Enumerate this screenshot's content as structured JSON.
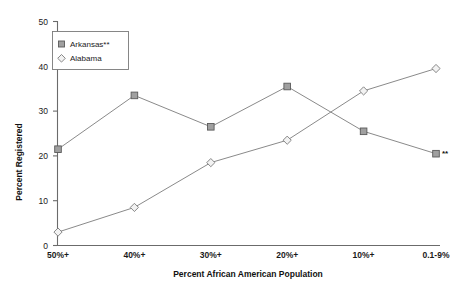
{
  "chart_data": {
    "type": "line",
    "title": "",
    "xlabel": "Percent African American Population",
    "ylabel": "Percent Registered",
    "categories": [
      "50%+",
      "40%+",
      "30%+",
      "20%+",
      "10%+",
      "0.1-9%"
    ],
    "ylim": [
      0,
      50
    ],
    "yticks": [
      0,
      10,
      20,
      30,
      40,
      50
    ],
    "ytick_labels": [
      "0",
      "10",
      "20",
      "30",
      "40",
      "50"
    ],
    "grid": false,
    "legend_position": "top-left",
    "series": [
      {
        "name": "Arkansas**",
        "marker": "square",
        "values": [
          21.5,
          33.5,
          26.5,
          35.5,
          25.5,
          20.5
        ]
      },
      {
        "name": "Alabama",
        "marker": "diamond",
        "values": [
          3.0,
          8.5,
          18.5,
          23.5,
          34.5,
          39.5
        ]
      }
    ],
    "annotations": [
      {
        "text": "**",
        "series": "Arkansas**",
        "category": "0.1-9%"
      }
    ]
  },
  "legend": {
    "entries": [
      {
        "label": "Arkansas**",
        "marker": "square-marker-icon"
      },
      {
        "label": "Alabama",
        "marker": "diamond-marker-icon"
      }
    ]
  },
  "axes": {
    "y_title": "Percent Registered",
    "x_title": "Percent African American Population",
    "y_labels": [
      "50",
      "40",
      "30",
      "20",
      "10",
      "0"
    ],
    "x_labels": [
      "50%+",
      "40%+",
      "30%+",
      "20%+",
      "10%+",
      "0.1-9%"
    ]
  },
  "colors": {
    "line": "#8a8a8a",
    "square_fill": "#a0a0a0",
    "diamond_fill": "#f2f2f2",
    "axis": "#6b6b6b",
    "text": "#111111",
    "background": "#ffffff"
  }
}
